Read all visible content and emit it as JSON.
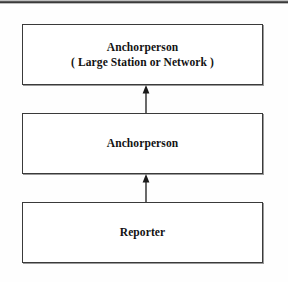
{
  "figure": {
    "type": "hierarchy-flow-diagram",
    "orientation": "vertical-bottom-up",
    "colors": {
      "background": "#ffffff",
      "box_fill": "#ffffff",
      "box_border": "#3a3a3a",
      "text": "#121212",
      "arrow": "#1a1a1a",
      "scan_edge": "#2a2a2a"
    },
    "nodes": [
      {
        "id": "anchor-network",
        "lines": [
          "Anchorperson",
          "( Large Station or Network )"
        ]
      },
      {
        "id": "anchor",
        "lines": [
          "Anchorperson"
        ]
      },
      {
        "id": "reporter",
        "lines": [
          "Reporter"
        ]
      }
    ],
    "arrows": [
      {
        "id": "reporter-to-anchor",
        "from": "reporter",
        "to": "anchor",
        "direction": "up",
        "icon": "arrow-up-icon"
      },
      {
        "id": "anchor-to-anchor-network",
        "from": "anchor",
        "to": "anchor-network",
        "direction": "up",
        "icon": "arrow-up-icon"
      }
    ]
  }
}
